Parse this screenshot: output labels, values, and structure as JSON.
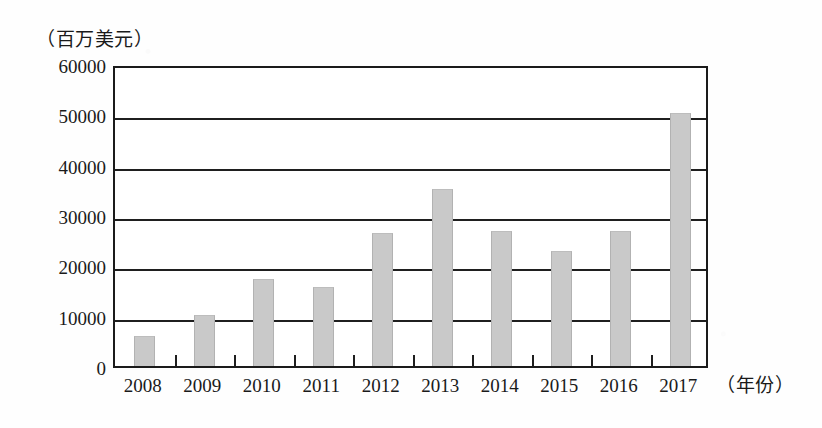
{
  "chart_data": {
    "type": "bar",
    "title": "",
    "subtitle": "",
    "xlabel": "（年份）",
    "ylabel": "（百万美元）",
    "categories": [
      "2008",
      "2009",
      "2010",
      "2011",
      "2012",
      "2013",
      "2014",
      "2015",
      "2016",
      "2017"
    ],
    "values": [
      6000,
      10200,
      17200,
      15700,
      26500,
      35200,
      26800,
      22800,
      26800,
      50300
    ],
    "ylim": [
      0,
      60000
    ],
    "yticks": [
      0,
      10000,
      20000,
      30000,
      40000,
      50000,
      60000
    ],
    "ytick_labels": [
      "0",
      "10000",
      "20000",
      "30000",
      "40000",
      "50000",
      "60000"
    ],
    "grid": true,
    "grid_axis": "y",
    "legend": false,
    "legend_position": "none",
    "bar_color": "#c9c9c9",
    "axis_color": "#1f1f1f",
    "background_color": "#ffffff"
  },
  "axes": {
    "y_unit_label": "（百万美元）",
    "x_unit_label": "（年份）"
  }
}
